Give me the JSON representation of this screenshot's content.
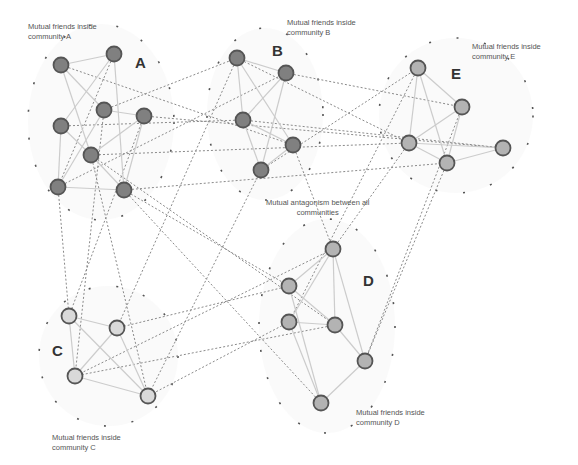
{
  "diagram": {
    "legend_notes": {
      "a": "Mutual friends inside\ncommunity A",
      "b": "Mutual friends inside\ncommunity B",
      "c": "Mutual friends inside\ncommunity C",
      "d": "Mutual friends inside\ncommunity D",
      "e": "Mutual friends inside\ncommunity E",
      "antagonism": "Mutual antagonism between  all\ncommunities"
    },
    "community_labels": {
      "a": "A",
      "b": "B",
      "c": "C",
      "d": "D",
      "e": "E"
    },
    "colors": {
      "community_A_B_fill": "#808080",
      "community_C_fill": "#d9d9d9",
      "community_D_E_fill": "#b3b3b3",
      "node_stroke": "#555555",
      "friend_edge": "#cccccc",
      "antagonism_edge": "#8a8a8a",
      "community_boundary": "#555555"
    },
    "communities": [
      {
        "id": "A",
        "fill": "#808080",
        "nodes": [
          [
            61,
            65
          ],
          [
            114,
            54
          ],
          [
            104,
            110
          ],
          [
            144,
            116
          ],
          [
            61,
            126
          ],
          [
            91,
            155
          ],
          [
            58,
            187
          ],
          [
            124,
            190
          ]
        ],
        "friend_edges": [
          [
            0,
            1
          ],
          [
            0,
            5
          ],
          [
            1,
            4
          ],
          [
            1,
            7
          ],
          [
            2,
            3
          ],
          [
            4,
            6
          ],
          [
            4,
            5
          ],
          [
            5,
            3
          ],
          [
            5,
            7
          ],
          [
            6,
            7
          ],
          [
            2,
            6
          ],
          [
            3,
            7
          ],
          [
            0,
            2
          ]
        ]
      },
      {
        "id": "B",
        "fill": "#808080",
        "nodes": [
          [
            237,
            58
          ],
          [
            286,
            73
          ],
          [
            243,
            120
          ],
          [
            293,
            145
          ],
          [
            261,
            170
          ]
        ],
        "friend_edges": [
          [
            0,
            1
          ],
          [
            0,
            2
          ],
          [
            0,
            3
          ],
          [
            1,
            2
          ],
          [
            1,
            4
          ],
          [
            2,
            3
          ],
          [
            2,
            4
          ],
          [
            3,
            4
          ]
        ]
      },
      {
        "id": "E",
        "fill": "#b3b3b3",
        "nodes": [
          [
            418,
            68
          ],
          [
            462,
            107
          ],
          [
            409,
            143
          ],
          [
            447,
            163
          ],
          [
            503,
            148
          ]
        ],
        "friend_edges": [
          [
            0,
            1
          ],
          [
            0,
            2
          ],
          [
            0,
            3
          ],
          [
            1,
            2
          ],
          [
            1,
            3
          ],
          [
            2,
            3
          ],
          [
            2,
            4
          ],
          [
            3,
            4
          ]
        ]
      },
      {
        "id": "D",
        "fill": "#b3b3b3",
        "nodes": [
          [
            333,
            249
          ],
          [
            289,
            286
          ],
          [
            289,
            322
          ],
          [
            335,
            325
          ],
          [
            365,
            361
          ],
          [
            321,
            403
          ]
        ],
        "friend_edges": [
          [
            0,
            1
          ],
          [
            0,
            2
          ],
          [
            0,
            3
          ],
          [
            0,
            4
          ],
          [
            1,
            3
          ],
          [
            1,
            5
          ],
          [
            2,
            3
          ],
          [
            2,
            5
          ],
          [
            3,
            4
          ],
          [
            4,
            5
          ]
        ]
      },
      {
        "id": "C",
        "fill": "#d9d9d9",
        "nodes": [
          [
            69,
            316
          ],
          [
            117,
            328
          ],
          [
            75,
            376
          ],
          [
            148,
            396
          ]
        ],
        "friend_edges": [
          [
            0,
            1
          ],
          [
            0,
            2
          ],
          [
            0,
            3
          ],
          [
            1,
            2
          ],
          [
            1,
            3
          ],
          [
            2,
            3
          ]
        ]
      }
    ],
    "antagonism_edges": [
      [
        [
          61,
          65
        ],
        [
          293,
          145
        ]
      ],
      [
        [
          114,
          54
        ],
        [
          58,
          187
        ]
      ],
      [
        [
          104,
          110
        ],
        [
          237,
          58
        ]
      ],
      [
        [
          144,
          116
        ],
        [
          503,
          148
        ]
      ],
      [
        [
          61,
          126
        ],
        [
          243,
          120
        ]
      ],
      [
        [
          91,
          155
        ],
        [
          409,
          143
        ]
      ],
      [
        [
          91,
          155
        ],
        [
          335,
          325
        ]
      ],
      [
        [
          58,
          187
        ],
        [
          286,
          73
        ]
      ],
      [
        [
          124,
          190
        ],
        [
          447,
          163
        ]
      ],
      [
        [
          124,
          190
        ],
        [
          321,
          403
        ]
      ],
      [
        [
          58,
          187
        ],
        [
          69,
          316
        ]
      ],
      [
        [
          104,
          110
        ],
        [
          75,
          376
        ]
      ],
      [
        [
          144,
          116
        ],
        [
          69,
          316
        ]
      ],
      [
        [
          91,
          155
        ],
        [
          148,
          396
        ]
      ],
      [
        [
          237,
          58
        ],
        [
          409,
          143
        ]
      ],
      [
        [
          243,
          120
        ],
        [
          503,
          148
        ]
      ],
      [
        [
          286,
          73
        ],
        [
          462,
          107
        ]
      ],
      [
        [
          261,
          170
        ],
        [
          418,
          68
        ]
      ],
      [
        [
          293,
          145
        ],
        [
          333,
          249
        ]
      ],
      [
        [
          261,
          170
        ],
        [
          148,
          396
        ]
      ],
      [
        [
          237,
          58
        ],
        [
          117,
          328
        ]
      ],
      [
        [
          418,
          68
        ],
        [
          289,
          322
        ]
      ],
      [
        [
          462,
          107
        ],
        [
          365,
          361
        ]
      ],
      [
        [
          409,
          143
        ],
        [
          333,
          249
        ]
      ],
      [
        [
          333,
          249
        ],
        [
          75,
          376
        ]
      ],
      [
        [
          289,
          286
        ],
        [
          117,
          328
        ]
      ],
      [
        [
          335,
          325
        ],
        [
          75,
          376
        ]
      ],
      [
        [
          289,
          322
        ],
        [
          148,
          396
        ]
      ],
      [
        [
          124,
          190
        ],
        [
          289,
          286
        ]
      ],
      [
        [
          447,
          163
        ],
        [
          365,
          361
        ]
      ]
    ]
  }
}
